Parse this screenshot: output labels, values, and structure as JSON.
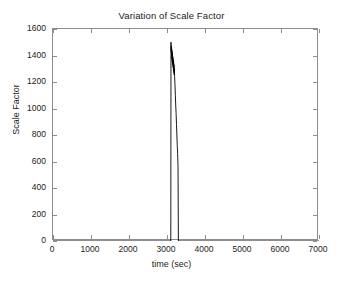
{
  "figure": {
    "background_color": "#ffffff",
    "axis_color": "#8d8d8d",
    "line_color": "#000000"
  },
  "chart_data": {
    "type": "line",
    "title": "Variation of Scale Factor",
    "xlabel": "time (sec)",
    "ylabel": "Scale Factor",
    "xlim": [
      0,
      7000
    ],
    "ylim": [
      0,
      1600
    ],
    "xticks": [
      0,
      1000,
      2000,
      3000,
      4000,
      5000,
      6000,
      7000
    ],
    "yticks": [
      0,
      200,
      400,
      600,
      800,
      1000,
      1200,
      1400,
      1600
    ],
    "xtick_labels": [
      "0",
      "1000",
      "2000",
      "3000",
      "4000",
      "5000",
      "6000",
      "7000"
    ],
    "ytick_labels": [
      "0",
      "200",
      "400",
      "600",
      "800",
      "1000",
      "1200",
      "1400",
      "1600"
    ],
    "grid": false,
    "legend": null,
    "series": [
      {
        "name": "Scale Factor",
        "color": "#000000",
        "description": "Flat at zero across the full time range except for a single narrow high-amplitude burst near t = 3100-3300 s that rises almost vertically to a peak of about 1500, oscillates densely while decaying, then drops back to zero.",
        "x": [
          0,
          500,
          1000,
          1500,
          2000,
          2500,
          3000,
          3080,
          3100,
          3105,
          3110,
          3115,
          3120,
          3125,
          3130,
          3135,
          3140,
          3145,
          3150,
          3155,
          3160,
          3165,
          3170,
          3175,
          3180,
          3185,
          3190,
          3195,
          3200,
          3210,
          3220,
          3230,
          3240,
          3250,
          3260,
          3270,
          3280,
          3290,
          3300,
          3400,
          4000,
          4500,
          5000,
          5500,
          6000,
          6500,
          7000
        ],
        "y": [
          0,
          0,
          0,
          0,
          0,
          0,
          0,
          0,
          0,
          1500,
          1430,
          1470,
          1400,
          1450,
          1370,
          1430,
          1350,
          1410,
          1330,
          1390,
          1310,
          1370,
          1290,
          1350,
          1270,
          1330,
          1255,
          1300,
          1240,
          1180,
          1100,
          1020,
          960,
          880,
          800,
          720,
          660,
          560,
          0,
          0,
          0,
          0,
          0,
          0,
          0,
          0,
          0
        ],
        "peak_value": 1500,
        "peak_time": 3105,
        "burst_start_time": 3100,
        "burst_end_time": 3300
      }
    ]
  }
}
